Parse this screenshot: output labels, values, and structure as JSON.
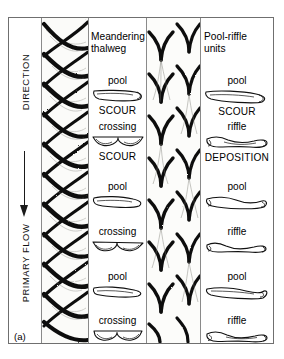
{
  "figure": {
    "caption": "(a)",
    "flow_axis": {
      "direction_label": "DIRECTION",
      "primary_label": "PRIMARY FLOW",
      "arrow": "down-arrow-icon"
    },
    "columns": [
      {
        "id": "braided-channel-left",
        "type": "image",
        "name": "braided-channel-photo"
      },
      {
        "id": "meandering-thalweg",
        "type": "labels",
        "title": "Meandering thalweg",
        "units": [
          {
            "label": "pool",
            "cross_section": "pool-cross-section",
            "process": "SCOUR"
          },
          {
            "label": "crossing",
            "cross_section": "crossing-cross-section",
            "process": "SCOUR"
          },
          {
            "label": "pool",
            "cross_section": "pool-cross-section",
            "process": ""
          },
          {
            "label": "crossing",
            "cross_section": "crossing-cross-section",
            "process": ""
          },
          {
            "label": "pool",
            "cross_section": "pool-cross-section",
            "process": ""
          },
          {
            "label": "crossing",
            "cross_section": "crossing-cross-section",
            "process": ""
          }
        ]
      },
      {
        "id": "braided-channel-right",
        "type": "image",
        "name": "chevron-bar-photo"
      },
      {
        "id": "pool-riffle-units",
        "type": "labels",
        "title": "Pool-riffle units",
        "units": [
          {
            "label": "pool",
            "cross_section": "pool-cross-section",
            "process": "SCOUR"
          },
          {
            "label": "riffle",
            "cross_section": "riffle-cross-section",
            "process": "DEPOSITION"
          },
          {
            "label": "pool",
            "cross_section": "pool-cross-section",
            "process": ""
          },
          {
            "label": "riffle",
            "cross_section": "riffle-cross-section",
            "process": ""
          },
          {
            "label": "pool",
            "cross_section": "pool-cross-section",
            "process": ""
          },
          {
            "label": "riffle",
            "cross_section": "riffle-cross-section",
            "process": ""
          }
        ]
      }
    ],
    "colors": {
      "frame": "#6f6f6f",
      "ink": "#000000",
      "panel_background": "#fdfdfc",
      "page_background": "#ffffff"
    }
  }
}
